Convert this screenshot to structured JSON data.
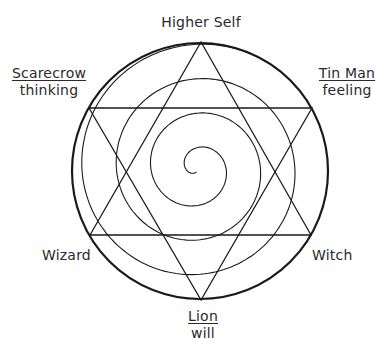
{
  "diagram": {
    "labels": {
      "top": {
        "title": "Higher Self"
      },
      "top_left": {
        "title": "Scarecrow",
        "subtitle": "thinking"
      },
      "top_right": {
        "title": "Tin Man",
        "subtitle": "feeling"
      },
      "bottom_left": {
        "title": "Wizard"
      },
      "bottom_right": {
        "title": "Witch"
      },
      "bottom": {
        "title": "Lion",
        "subtitle": "will"
      }
    },
    "shapes": {
      "circle": {
        "cx": 200,
        "cy": 171,
        "r": 128
      },
      "hexagram": "two overlapping equilateral triangles inscribed in circle",
      "spiral": "spiral from center outward to bottom vertex"
    },
    "colors": {
      "stroke": "#1a1a1a",
      "text": "#2a2a2a",
      "background": "#ffffff"
    }
  }
}
